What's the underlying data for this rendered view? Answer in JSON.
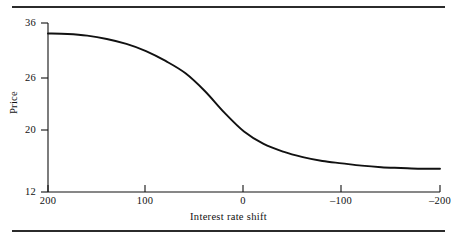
{
  "figure": {
    "frame_rules": 2,
    "line_color": "#111111",
    "background_color": "#ffffff"
  },
  "chart_data": {
    "type": "line",
    "title": "",
    "subtitle": "",
    "xlabel": "Interest rate shift",
    "ylabel": "Price",
    "grid": false,
    "legend": null,
    "x_tick_labels": [
      "200",
      "100",
      "0",
      "–100",
      "–200"
    ],
    "x_tick_values": [
      200,
      100,
      0,
      -100,
      -200
    ],
    "y_tick_labels": [
      "36",
      "26",
      "20",
      "12"
    ],
    "y_tick_values": [
      36,
      26,
      20,
      12
    ],
    "xlim": [
      200,
      -200
    ],
    "ylim": [
      12,
      36
    ],
    "x_axis_direction": "decreasing-left-to-right",
    "series": [
      {
        "name": "Price vs interest rate shift",
        "x": [
          200,
          180,
          160,
          140,
          120,
          100,
          80,
          60,
          40,
          20,
          0,
          -20,
          -40,
          -60,
          -80,
          -100,
          -120,
          -140,
          -160,
          -180,
          -200
        ],
        "values": [
          34.1,
          34.0,
          33.7,
          33.1,
          32.2,
          30.9,
          29.1,
          26.9,
          24.5,
          22.0,
          19.8,
          18.2,
          17.2,
          16.5,
          16.0,
          15.7,
          15.4,
          15.2,
          15.1,
          15.0,
          15.0
        ]
      }
    ],
    "annotations": []
  }
}
